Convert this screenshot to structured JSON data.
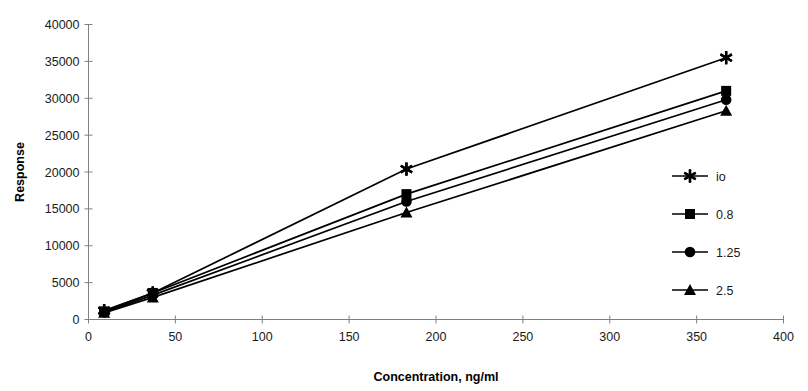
{
  "chart_data": {
    "type": "line",
    "title": "",
    "xlabel": "Concentration, ng/ml",
    "ylabel": "Response",
    "xlim": [
      0,
      400
    ],
    "ylim": [
      0,
      40000
    ],
    "xticks": [
      0,
      50,
      100,
      150,
      200,
      250,
      300,
      350,
      400
    ],
    "xtick_labels": [
      "0",
      "50",
      "100",
      "150",
      "200",
      "250",
      "300",
      "350",
      "400"
    ],
    "yticks": [
      0,
      5000,
      10000,
      15000,
      20000,
      25000,
      30000,
      35000,
      40000
    ],
    "ytick_labels": [
      "0",
      "5000",
      "10000",
      "15000",
      "20000",
      "25000",
      "30000",
      "35000",
      "40000"
    ],
    "grid": false,
    "legend_position": "right",
    "x": [
      9,
      37,
      183,
      367
    ],
    "series": [
      {
        "name": "io",
        "marker": "star",
        "values": [
          1200,
          3600,
          20400,
          35500
        ]
      },
      {
        "name": "0.8",
        "marker": "square",
        "values": [
          1100,
          3600,
          17000,
          31000
        ]
      },
      {
        "name": "1.25",
        "marker": "circle",
        "values": [
          1000,
          3300,
          16000,
          29800
        ]
      },
      {
        "name": "2.5",
        "marker": "triangle",
        "values": [
          900,
          3000,
          14500,
          28300
        ]
      }
    ]
  },
  "axes": {
    "y_title": "Response",
    "x_title": "Concentration, ng/ml"
  },
  "legend": {
    "entries": [
      {
        "label": "io"
      },
      {
        "label": "0.8"
      },
      {
        "label": "1.25"
      },
      {
        "label": "2.5"
      }
    ]
  },
  "colors": {
    "series": "#000000",
    "axis": "#808080",
    "text": "#1a1a1a",
    "background": "#ffffff"
  },
  "ghost_title": ""
}
